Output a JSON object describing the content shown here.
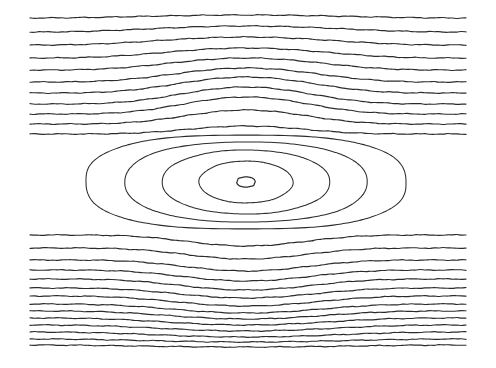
{
  "figure": {
    "title": "",
    "background_color": "#ffffff",
    "line_color": "#2b2b2b",
    "width_px": 496,
    "height_px": 368
  },
  "chart_data": {
    "type": "line",
    "title": "",
    "subtitle": "",
    "xlabel": "",
    "ylabel": "",
    "grid": false,
    "legend_position": "none",
    "axes_visible": false,
    "tick_labels_x": [],
    "tick_labels_y": [],
    "plot_box": {
      "x0": 30,
      "y0": 14,
      "x1": 466,
      "y1": 346
    },
    "eddy_center": {
      "x": 246,
      "y": 182
    },
    "separatrix_y_upper": 138,
    "separatrix_y_lower": 232,
    "closed_contour_count": 5,
    "open_streamline_count_upper": 11,
    "open_streamline_count_lower": 14,
    "closed_contours": [
      {
        "level": 1,
        "semi_axis_x": 160,
        "semi_axis_y": 47,
        "squareness": 2.6
      },
      {
        "level": 2,
        "semi_axis_x": 121,
        "semi_axis_y": 40,
        "squareness": 2.3
      },
      {
        "level": 3,
        "semi_axis_x": 84,
        "semi_axis_y": 32,
        "squareness": 2.1
      },
      {
        "level": 4,
        "semi_axis_x": 47,
        "semi_axis_y": 21,
        "squareness": 2.0
      },
      {
        "level": 5,
        "semi_axis_x": 9,
        "semi_axis_y": 5,
        "squareness": 2.4
      }
    ],
    "upper_streamlines_left_edge_y": [
      18,
      32,
      45,
      58,
      70,
      82,
      93,
      104,
      114,
      124,
      134
    ],
    "upper_streamlines_center_y": [
      15,
      26,
      37,
      48,
      58,
      68,
      77,
      87,
      97,
      110,
      126
    ],
    "lower_streamlines_left_edge_y": [
      235,
      248,
      260,
      270,
      279,
      288,
      296,
      304,
      311,
      318,
      325,
      332,
      339,
      345
    ],
    "lower_streamlines_center_y": [
      246,
      259,
      271,
      281,
      290,
      298,
      306,
      313,
      319,
      325,
      331,
      337,
      342,
      347
    ],
    "series": [
      {
        "name": "upper-streamlines",
        "values": [
          18,
          32,
          45,
          58,
          70,
          82,
          93,
          104,
          114,
          124,
          134
        ]
      },
      {
        "name": "lower-streamlines",
        "values": [
          235,
          248,
          260,
          270,
          279,
          288,
          296,
          304,
          311,
          318,
          325,
          332,
          339,
          345
        ]
      }
    ],
    "xlim": [
      30,
      466
    ],
    "ylim": [
      14,
      346
    ]
  }
}
